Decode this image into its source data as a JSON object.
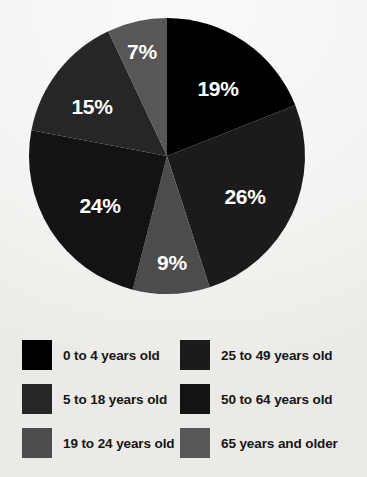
{
  "chart_data": {
    "type": "pie",
    "title": "",
    "subtitle": "",
    "xlabel": "",
    "ylabel": "",
    "grid": false,
    "legend_position": "bottom",
    "start_angle_deg": 0,
    "direction": "clockwise",
    "categories": [
      "0 to 4 years old",
      "25 to 49 years old",
      "5 to 18 years old",
      "50 to 64 years old",
      "19 to 24 years old",
      "65 years and older"
    ],
    "slices": [
      {
        "label": "0 to 4 years old",
        "value": 19,
        "data_label": "19%",
        "color": "#000000"
      },
      {
        "label": "25 to 49 years old",
        "value": 26,
        "data_label": "26%",
        "color": "#1b1b1b"
      },
      {
        "label": "19 to 24 years old",
        "value": 9,
        "data_label": "9%",
        "color": "#4c4c4c"
      },
      {
        "label": "50 to 64 years old",
        "value": 24,
        "data_label": "24%",
        "color": "#131313"
      },
      {
        "label": "5 to 18 years old",
        "value": 15,
        "data_label": "15%",
        "color": "#262626"
      },
      {
        "label": "65 years and older",
        "value": 7,
        "data_label": "7%",
        "color": "#575757"
      }
    ],
    "values": [
      19,
      26,
      9,
      24,
      15,
      7
    ],
    "data_labels": [
      "19%",
      "26%",
      "9%",
      "24%",
      "15%",
      "7%"
    ],
    "total": 100,
    "units": "percent"
  },
  "pie": {
    "center_x": 167,
    "center_y": 156,
    "radius": 138,
    "label_color": "#ffffff",
    "labels": [
      {
        "text": "19%",
        "x": 218,
        "y": 90
      },
      {
        "text": "26%",
        "x": 245,
        "y": 198
      },
      {
        "text": "9%",
        "x": 172,
        "y": 264
      },
      {
        "text": "24%",
        "x": 100,
        "y": 207
      },
      {
        "text": "15%",
        "x": 92,
        "y": 108
      },
      {
        "text": "7%",
        "x": 142,
        "y": 53
      }
    ]
  },
  "legend": {
    "items": [
      {
        "label": "0 to 4 years old",
        "color": "#000000",
        "column": "left",
        "row": 1
      },
      {
        "label": "25 to 49 years old",
        "color": "#1b1b1b",
        "column": "right",
        "row": 1
      },
      {
        "label": "5 to 18 years old",
        "color": "#262626",
        "column": "left",
        "row": 2
      },
      {
        "label": "50 to 64 years old",
        "color": "#131313",
        "column": "right",
        "row": 2
      },
      {
        "label": "19 to 24 years old",
        "color": "#4c4c4c",
        "column": "left",
        "row": 3
      },
      {
        "label": "65 years and older",
        "color": "#575757",
        "column": "right",
        "row": 3
      }
    ]
  },
  "theme": {
    "background": "#f6f5f3",
    "text_color": "#151515",
    "label_text_color": "#ffffff"
  }
}
